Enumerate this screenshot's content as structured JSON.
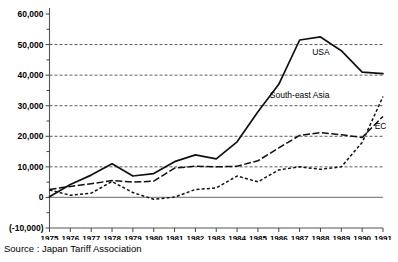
{
  "chart_data": {
    "type": "line",
    "title": "",
    "xlabel": "",
    "ylabel": "",
    "x": [
      1975,
      1976,
      1977,
      1978,
      1979,
      1980,
      1981,
      1982,
      1983,
      1984,
      1985,
      1986,
      1987,
      1988,
      1989,
      1990,
      1991
    ],
    "categories": [
      "1975",
      "1976",
      "1977",
      "1978",
      "1979",
      "1980",
      "1981",
      "1982",
      "1983",
      "1984",
      "1985",
      "1986",
      "1987",
      "1988",
      "1989",
      "1990",
      "1991"
    ],
    "ylim": [
      -10000,
      60000
    ],
    "yticks": [
      -10000,
      0,
      10000,
      20000,
      30000,
      40000,
      50000,
      60000
    ],
    "ytick_labels": [
      "(-10,000)",
      "0",
      "10,000",
      "20,000",
      "30,000",
      "40,000",
      "50,000",
      "60,000"
    ],
    "gridlines": [
      10000,
      20000,
      30000,
      40000,
      50000
    ],
    "grid": true,
    "legend_position": "inline-right",
    "series": [
      {
        "name": "USA",
        "style": "solid",
        "values": [
          200,
          4200,
          7300,
          11000,
          7000,
          7800,
          11700,
          13900,
          12600,
          18200,
          28000,
          37000,
          51500,
          52500,
          48000,
          41000,
          40500
        ]
      },
      {
        "name": "South-east Asia",
        "style": "dashed-short",
        "values": [
          2400,
          700,
          1400,
          5200,
          1600,
          -600,
          100,
          2600,
          3100,
          7000,
          5100,
          9000,
          10000,
          9200,
          10000,
          18000,
          33000
        ]
      },
      {
        "name": "EC",
        "style": "dashed-long",
        "values": [
          2600,
          3600,
          4500,
          5500,
          5000,
          5300,
          9600,
          10200,
          10000,
          10200,
          12000,
          16200,
          20300,
          21200,
          20500,
          19600,
          26500
        ]
      }
    ],
    "annotations": [
      {
        "text": "USA",
        "x": 1987.6,
        "y": 46500
      },
      {
        "text": "South-east Asia",
        "x": 1987.0,
        "y": 32500
      },
      {
        "text": "EC",
        "x": 1990.6,
        "y": 22500
      }
    ]
  },
  "footer": {
    "source": "Source : Japan Tariff Association"
  }
}
